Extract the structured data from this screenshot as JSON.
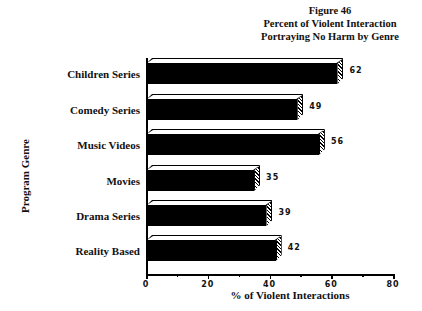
{
  "chart_data": {
    "type": "bar",
    "orientation": "horizontal",
    "title": "Figure 46",
    "subtitle": "Percent of Violent Interaction Portraying No Harm by Genre",
    "title_lines": [
      "Figure 46",
      "Percent of Violent Interaction",
      "Portraying No Harm by Genre"
    ],
    "xlabel": "% of Violent Interactions",
    "ylabel": "Program Genre",
    "categories": [
      "Children Series",
      "Comedy Series",
      "Music Videos",
      "Movies",
      "Drama Series",
      "Reality Based"
    ],
    "values": [
      62,
      49,
      56,
      35,
      39,
      42
    ],
    "value_labels": [
      "62",
      "49",
      "56",
      "35",
      "39",
      "42"
    ],
    "xlim": [
      0,
      80
    ],
    "xticks": [
      "0",
      "20",
      "40",
      "60",
      "80"
    ],
    "grid": false,
    "legend": null,
    "style": "3d-bars",
    "bar_color": "#000000"
  }
}
